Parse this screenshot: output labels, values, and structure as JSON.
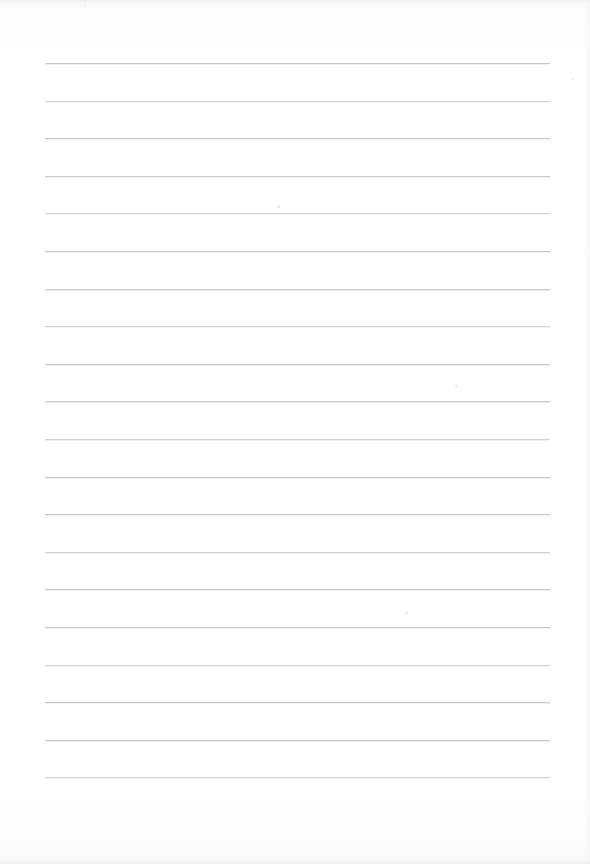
{
  "document": {
    "type": "lined-paper",
    "title": "Blank ruled notebook page",
    "page_width": 590,
    "page_height": 864,
    "background_color": "#fdfdfd",
    "handwriting_text": "",
    "typed_text": "",
    "header_text": "",
    "footer_text": "",
    "page_number": ""
  },
  "ruling": {
    "line_color": "#c3c7cb",
    "line_count": 20,
    "line_thickness_px": 1,
    "line_start_x": 45,
    "line_end_x": 550,
    "first_line_y": 63,
    "line_spacing_px": 37.6,
    "margin_line_visible": false,
    "margin_line_color": "",
    "left_margin_px": 45,
    "right_margin_px": 40,
    "top_margin_px": 63,
    "bottom_margin_px": 87,
    "line_y_positions": [
      63,
      100.6,
      138.2,
      175.8,
      213.4,
      251,
      288.6,
      326.2,
      363.8,
      401.4,
      439,
      476.6,
      514.2,
      551.8,
      589.4,
      627,
      664.6,
      702.2,
      739.8,
      777.4
    ]
  },
  "scan_artifacts": {
    "top_edge_shadow": true,
    "bottom_edge_shadow": true,
    "right_edge_shadow": true,
    "specks": [
      {
        "x": 277,
        "y": 205,
        "size": 3
      },
      {
        "x": 455,
        "y": 385,
        "size": 3
      },
      {
        "x": 405,
        "y": 611,
        "size": 3
      },
      {
        "x": 572,
        "y": 78,
        "size": 2
      },
      {
        "x": 84,
        "y": 5,
        "size": 2
      }
    ]
  }
}
